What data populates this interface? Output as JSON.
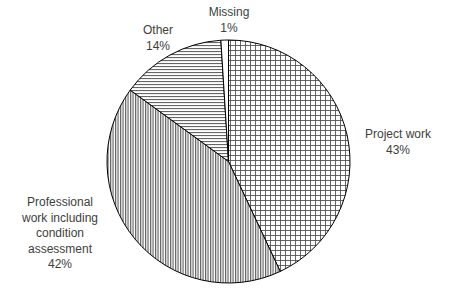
{
  "chart_data": {
    "type": "pie",
    "title": "",
    "start_angle_deg": 0,
    "direction": "clockwise",
    "slices": [
      {
        "label": "Project work",
        "value": 43,
        "display": "43%",
        "pattern": "grid"
      },
      {
        "label": "Professional work including condition assessment",
        "value": 42,
        "display": "42%",
        "pattern": "vertical"
      },
      {
        "label": "Other",
        "value": 14,
        "display": "14%",
        "pattern": "horizontal"
      },
      {
        "label": "Missing",
        "value": 1,
        "display": "1%",
        "pattern": "none"
      }
    ],
    "legend": "none",
    "data_labels": "category and percentage outside slices"
  },
  "labels": {
    "project": {
      "lines": [
        "Project work"
      ],
      "pct": "43%"
    },
    "professional": {
      "lines": [
        "Professional",
        "work including",
        "condition",
        "assessment"
      ],
      "pct": "42%"
    },
    "other": {
      "lines": [
        "Other"
      ],
      "pct": "14%"
    },
    "missing": {
      "lines": [
        "Missing"
      ],
      "pct": "1%"
    }
  },
  "colors": {
    "outline": "#000000",
    "hatch": "#555555",
    "label_text": "#404040",
    "background": "#ffffff"
  }
}
